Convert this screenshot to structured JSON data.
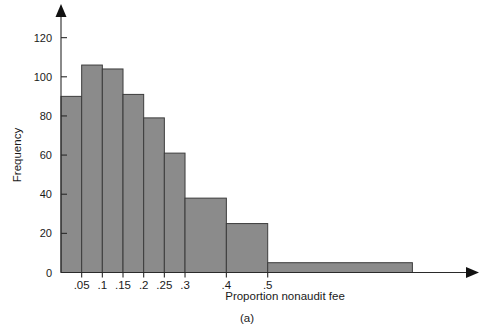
{
  "figure": {
    "caption": "(a)",
    "width": 495,
    "height": 330
  },
  "chart_data": {
    "type": "bar",
    "title": "",
    "subtitle": "",
    "xlabel": "Proportion nonaudit fee",
    "ylabel": "Frequency",
    "bin_edges": [
      0,
      0.05,
      0.1,
      0.15,
      0.2,
      0.25,
      0.3,
      0.4,
      0.5,
      0.85
    ],
    "categories": [
      "0-.05",
      ".05-.1",
      ".1-.15",
      ".15-.2",
      ".2-.25",
      ".25-.3",
      ".3-.4",
      ".4-.5",
      ".5-.85"
    ],
    "values": [
      90,
      106,
      104,
      91,
      79,
      61,
      38,
      25,
      5
    ],
    "xtick_labels": [
      ".05",
      ".1",
      ".15",
      ".2",
      ".25",
      ".3",
      ".4",
      ".5"
    ],
    "xtick_values": [
      0.05,
      0.1,
      0.15,
      0.2,
      0.25,
      0.3,
      0.4,
      0.5
    ],
    "ytick_labels": [
      "0",
      "20",
      "40",
      "60",
      "80",
      "100",
      "120"
    ],
    "ytick_values": [
      0,
      20,
      40,
      60,
      80,
      100,
      120
    ],
    "ylim": [
      0,
      128
    ],
    "xlim": [
      0,
      0.97
    ],
    "grid": false,
    "legend": false,
    "legend_position": "none",
    "bar_color": "#8b8b8b",
    "bar_edge_color": "#3c3c3c",
    "axis_color": "#2a2a2a",
    "text_color": "#1a1a1a"
  }
}
